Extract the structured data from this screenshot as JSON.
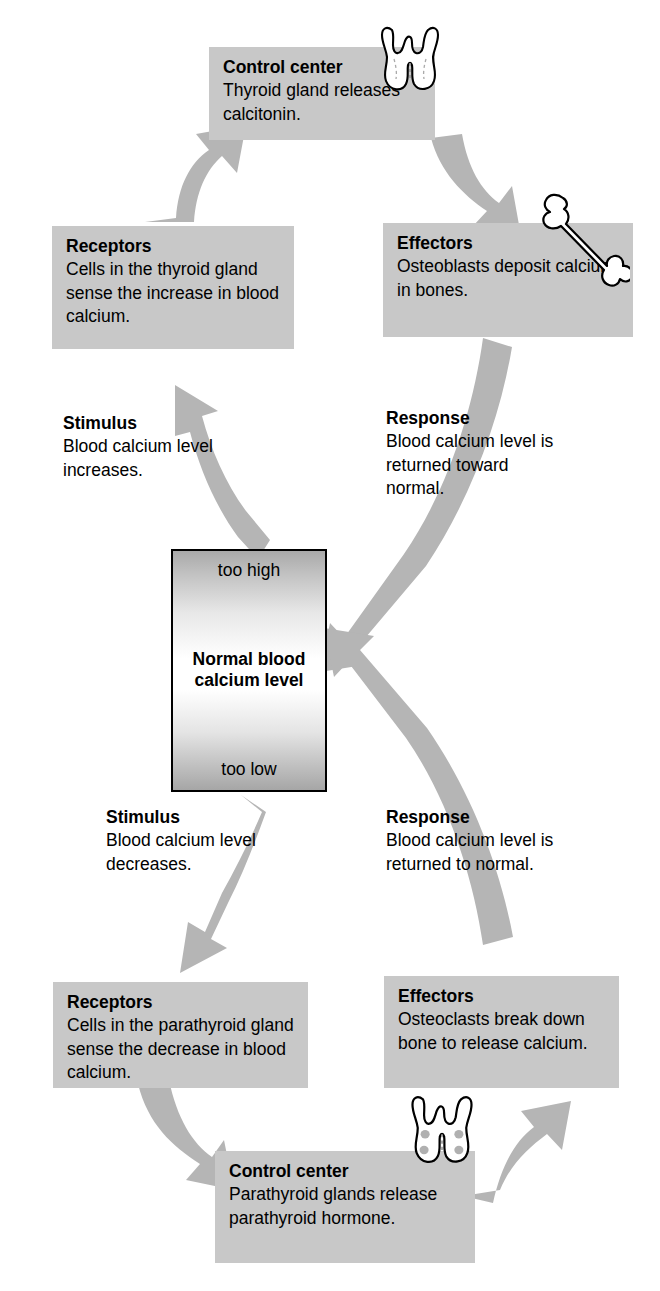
{
  "diagram": {
    "colors": {
      "box_fill": "#c8c8c8",
      "arrow_fill": "#b5b5b5",
      "text": "#000000",
      "background": "#ffffff"
    },
    "center": {
      "top_label": "too high",
      "main_line1": "Normal blood",
      "main_line2": "calcium level",
      "bottom_label": "too low"
    },
    "upper_loop": {
      "control_center": {
        "title": "Control center",
        "body": "Thyroid gland releases calcitonin.",
        "icon": "thyroid-gland-icon"
      },
      "effectors": {
        "title": "Effectors",
        "body": "Osteoblasts deposit calcium in bones.",
        "icon": "bone-icon"
      },
      "receptors": {
        "title": "Receptors",
        "body": "Cells in the thyroid gland sense the increase in blood calcium."
      },
      "stimulus": {
        "title": "Stimulus",
        "body": "Blood calcium level increases."
      },
      "response": {
        "title": "Response",
        "body": "Blood calcium level is returned toward normal."
      }
    },
    "lower_loop": {
      "control_center": {
        "title": "Control center",
        "body": "Parathyroid glands release parathyroid hormone.",
        "icon": "parathyroid-gland-icon"
      },
      "effectors": {
        "title": "Effectors",
        "body": "Osteoclasts break down bone to release calcium."
      },
      "receptors": {
        "title": "Receptors",
        "body": "Cells in the parathyroid gland sense the decrease in blood calcium."
      },
      "stimulus": {
        "title": "Stimulus",
        "body": "Blood calcium level decreases."
      },
      "response": {
        "title": "Response",
        "body": "Blood calcium level is returned to normal."
      }
    }
  }
}
